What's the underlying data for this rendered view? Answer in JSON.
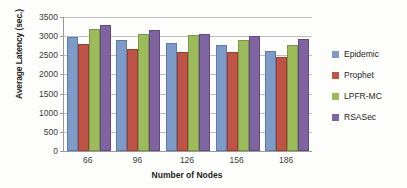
{
  "chart_data": {
    "type": "bar",
    "title": "",
    "xlabel": "Number of Nodes",
    "ylabel": "Average Latency (sec.)",
    "categories": [
      "66",
      "96",
      "126",
      "156",
      "186"
    ],
    "series": [
      {
        "name": "Epidemic",
        "color": "#7d9ac9",
        "values": [
          2930,
          2850,
          2770,
          2720,
          2570
        ]
      },
      {
        "name": "Prophet",
        "color": "#bf5446",
        "values": [
          2730,
          2620,
          2540,
          2530,
          2410
        ]
      },
      {
        "name": "LPFR-MC",
        "color": "#9cbb5a",
        "values": [
          3140,
          3000,
          2970,
          2860,
          2720
        ]
      },
      {
        "name": "RSASec",
        "color": "#8064a2",
        "values": [
          3230,
          3120,
          3000,
          2950,
          2880
        ]
      }
    ],
    "ylim": [
      0,
      3500
    ],
    "yticks": [
      0,
      500,
      1000,
      1500,
      2000,
      2500,
      3000,
      3500
    ],
    "ytick_labels": [
      "0",
      "500",
      "1000",
      "1500",
      "2000",
      "2500",
      "3000",
      "3500"
    ],
    "grid": true,
    "legend_position": "right"
  }
}
